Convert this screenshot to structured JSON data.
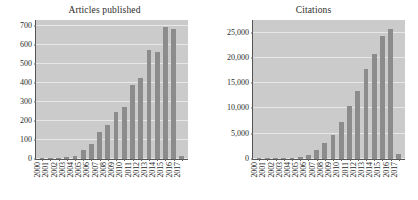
{
  "figure": {
    "background_color": "#ffffff",
    "panel_count": 2
  },
  "style": {
    "plot_background": "#cbcbcb",
    "bar_color": "#8c8c8c",
    "gridline_color": "#ffffff",
    "axis_color": "#555555",
    "text_color": "#2b2b2b"
  },
  "chart_data": [
    {
      "type": "bar",
      "title": "Articles published",
      "xlabel": "",
      "ylabel": "",
      "grid": true,
      "legend": "none",
      "ylim": [
        0,
        730
      ],
      "yticks": [
        0,
        100,
        200,
        300,
        400,
        500,
        600,
        700
      ],
      "ytick_labels": [
        "0",
        "100",
        "200",
        "300",
        "400",
        "500",
        "600",
        "700"
      ],
      "categories": [
        "2000",
        "2001",
        "2002",
        "2003",
        "2004",
        "2005",
        "2006",
        "2007",
        "2008",
        "2009",
        "2010",
        "2011",
        "2012",
        "2013",
        "2014",
        "2015",
        "2016",
        "2017"
      ],
      "values": [
        3,
        4,
        7,
        13,
        16,
        45,
        78,
        143,
        180,
        246,
        274,
        389,
        428,
        575,
        561,
        691,
        684,
        15
      ]
    },
    {
      "type": "bar",
      "title": "Citations",
      "xlabel": "",
      "ylabel": "",
      "grid": true,
      "legend": "none",
      "ylim": [
        0,
        27500
      ],
      "yticks": [
        0,
        5000,
        10000,
        15000,
        20000,
        25000
      ],
      "ytick_labels": [
        "0",
        "5,000",
        "10,000",
        "15,000",
        "20,000",
        "25,000"
      ],
      "categories": [
        "2000",
        "2001",
        "2002",
        "2003",
        "2004",
        "2005",
        "2006",
        "2007",
        "2008",
        "2009",
        "2010",
        "2011",
        "2012",
        "2013",
        "2014",
        "2015",
        "2016",
        "2017"
      ],
      "values": [
        10,
        20,
        40,
        70,
        180,
        330,
        820,
        1750,
        3150,
        4800,
        7300,
        10500,
        13400,
        17800,
        20700,
        24400,
        25800,
        900
      ]
    }
  ]
}
